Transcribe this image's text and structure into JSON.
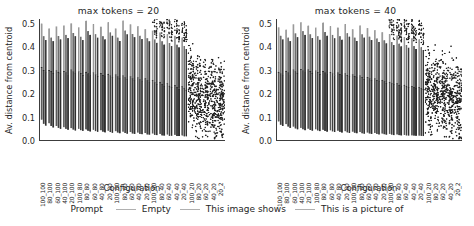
{
  "figure": {
    "width": 474,
    "height": 226,
    "background": "#ffffff"
  },
  "legend": {
    "title": "Prompt",
    "entries": [
      {
        "label": "Empty",
        "color": "#b0b0b0"
      },
      {
        "label": "This image shows",
        "color": "#b0b0b0"
      },
      {
        "label": "This is a picture of",
        "color": "#b0b0b0"
      }
    ]
  },
  "chart_data": {
    "type": "bar",
    "title": "",
    "xlabel": "Configuration",
    "ylabel": "Av. distance from centroid",
    "ylim": [
      0.0,
      0.52
    ],
    "yticks": [
      0.0,
      0.1,
      0.2,
      0.3,
      0.4,
      0.5
    ],
    "ytick_labels": [
      "0.0",
      "0.1",
      "0.2",
      "0.3",
      "0.4",
      "0.5"
    ],
    "grid": false,
    "legend_position": "bottom-center",
    "panels": [
      {
        "title": "max tokens = 20",
        "categories": [
          "100_100",
          "80_100",
          "60_100",
          "40_100",
          "20_100",
          "100_80",
          "80_80",
          "60_80",
          "40_80",
          "20_80",
          "100_60",
          "80_60",
          "60_60",
          "40_60",
          "20_60",
          "100_40",
          "80_40",
          "60_40",
          "40_40",
          "20_40",
          "100_20",
          "80_20",
          "60_20",
          "40_20",
          "20_2"
        ],
        "series": [
          {
            "name": "Empty",
            "values": [
              0.313,
              0.3,
              0.299,
              0.296,
              0.302,
              0.295,
              0.293,
              0.289,
              0.288,
              0.284,
              0.281,
              0.276,
              0.272,
              0.268,
              0.265,
              0.258,
              0.25,
              0.243,
              0.236,
              0.23,
              0.215,
              0.205,
              0.196,
              0.188,
              0.178
            ],
            "whisker_high": [
              0.5,
              0.479,
              0.488,
              0.492,
              0.501,
              0.484,
              0.512,
              0.498,
              0.487,
              0.506,
              0.479,
              0.513,
              0.497,
              0.489,
              0.476,
              0.47,
              0.462,
              0.455,
              0.448,
              0.44,
              0.43,
              0.42,
              0.41,
              0.4,
              0.392
            ],
            "whisker_low": [
              0.088,
              0.072,
              0.06,
              0.055,
              0.051,
              0.048,
              0.046,
              0.044,
              0.042,
              0.04,
              0.038,
              0.036,
              0.034,
              0.032,
              0.03,
              0.028,
              0.026,
              0.024,
              0.022,
              0.02,
              0.018,
              0.016,
              0.014,
              0.012,
              0.01
            ]
          },
          {
            "name": "This image shows",
            "values": [
              0.3,
              0.296,
              0.293,
              0.29,
              0.294,
              0.288,
              0.286,
              0.282,
              0.28,
              0.276,
              0.272,
              0.268,
              0.264,
              0.26,
              0.256,
              0.248,
              0.24,
              0.233,
              0.227,
              0.221,
              0.207,
              0.197,
              0.189,
              0.181,
              0.172
            ],
            "whisker_high": [
              0.446,
              0.44,
              0.447,
              0.452,
              0.46,
              0.444,
              0.468,
              0.455,
              0.446,
              0.462,
              0.44,
              0.47,
              0.456,
              0.448,
              0.437,
              0.432,
              0.424,
              0.417,
              0.41,
              0.404,
              0.394,
              0.386,
              0.378,
              0.37,
              0.36
            ],
            "whisker_low": [
              0.07,
              0.06,
              0.052,
              0.048,
              0.045,
              0.042,
              0.04,
              0.038,
              0.036,
              0.034,
              0.032,
              0.03,
              0.028,
              0.026,
              0.024,
              0.022,
              0.02,
              0.018,
              0.017,
              0.016,
              0.015,
              0.014,
              0.013,
              0.012,
              0.011
            ]
          },
          {
            "name": "This is a picture of",
            "values": [
              0.29,
              0.288,
              0.285,
              0.282,
              0.286,
              0.28,
              0.278,
              0.274,
              0.272,
              0.268,
              0.264,
              0.26,
              0.256,
              0.252,
              0.248,
              0.24,
              0.232,
              0.226,
              0.22,
              0.214,
              0.2,
              0.191,
              0.183,
              0.175,
              0.166
            ],
            "whisker_high": [
              0.43,
              0.425,
              0.432,
              0.438,
              0.446,
              0.43,
              0.452,
              0.44,
              0.432,
              0.448,
              0.426,
              0.454,
              0.442,
              0.434,
              0.424,
              0.418,
              0.41,
              0.404,
              0.398,
              0.392,
              0.382,
              0.374,
              0.366,
              0.358,
              0.348
            ],
            "whisker_low": [
              0.062,
              0.054,
              0.048,
              0.044,
              0.041,
              0.039,
              0.037,
              0.035,
              0.033,
              0.031,
              0.029,
              0.027,
              0.026,
              0.025,
              0.023,
              0.021,
              0.019,
              0.018,
              0.017,
              0.016,
              0.015,
              0.014,
              0.013,
              0.012,
              0.011
            ]
          }
        ],
        "outlier_region_start_index": 15,
        "scatter_region_start_index": 20
      },
      {
        "title": "max tokens = 40",
        "categories": [
          "100_100",
          "80_100",
          "60_100",
          "40_100",
          "20_100",
          "100_80",
          "80_80",
          "60_80",
          "40_80",
          "20_80",
          "100_60",
          "80_60",
          "60_60",
          "40_60",
          "20_60",
          "100_40",
          "80_40",
          "60_40",
          "40_40",
          "20_40",
          "100_20",
          "80_20",
          "60_20",
          "40_20",
          "20_2"
        ],
        "series": [
          {
            "name": "Empty",
            "values": [
              0.293,
              0.297,
              0.302,
              0.305,
              0.303,
              0.298,
              0.296,
              0.292,
              0.29,
              0.286,
              0.282,
              0.276,
              0.27,
              0.264,
              0.258,
              0.25,
              0.243,
              0.237,
              0.232,
              0.228,
              0.216,
              0.206,
              0.197,
              0.189,
              0.18
            ],
            "whisker_high": [
              0.484,
              0.474,
              0.497,
              0.506,
              0.491,
              0.483,
              0.504,
              0.489,
              0.483,
              0.498,
              0.476,
              0.492,
              0.481,
              0.472,
              0.463,
              0.456,
              0.449,
              0.443,
              0.437,
              0.432,
              0.422,
              0.414,
              0.406,
              0.398,
              0.388
            ],
            "whisker_low": [
              0.08,
              0.068,
              0.058,
              0.052,
              0.049,
              0.046,
              0.044,
              0.042,
              0.04,
              0.038,
              0.036,
              0.034,
              0.032,
              0.03,
              0.028,
              0.026,
              0.024,
              0.022,
              0.02,
              0.019,
              0.017,
              0.016,
              0.014,
              0.013,
              0.011
            ]
          },
          {
            "name": "This image shows",
            "values": [
              0.285,
              0.29,
              0.295,
              0.298,
              0.296,
              0.291,
              0.289,
              0.285,
              0.283,
              0.279,
              0.275,
              0.27,
              0.264,
              0.258,
              0.252,
              0.244,
              0.237,
              0.232,
              0.227,
              0.223,
              0.21,
              0.2,
              0.192,
              0.184,
              0.175
            ],
            "whisker_high": [
              0.448,
              0.44,
              0.458,
              0.468,
              0.454,
              0.446,
              0.464,
              0.452,
              0.446,
              0.459,
              0.44,
              0.454,
              0.444,
              0.436,
              0.428,
              0.421,
              0.414,
              0.409,
              0.403,
              0.398,
              0.389,
              0.381,
              0.374,
              0.366,
              0.357
            ],
            "whisker_low": [
              0.066,
              0.058,
              0.05,
              0.046,
              0.043,
              0.041,
              0.039,
              0.037,
              0.035,
              0.033,
              0.031,
              0.029,
              0.028,
              0.026,
              0.025,
              0.023,
              0.021,
              0.02,
              0.019,
              0.018,
              0.016,
              0.015,
              0.014,
              0.013,
              0.012
            ]
          },
          {
            "name": "This is a picture of",
            "values": [
              0.277,
              0.282,
              0.287,
              0.29,
              0.288,
              0.284,
              0.282,
              0.278,
              0.276,
              0.272,
              0.268,
              0.263,
              0.257,
              0.252,
              0.246,
              0.238,
              0.231,
              0.226,
              0.221,
              0.217,
              0.204,
              0.195,
              0.187,
              0.179,
              0.17
            ],
            "whisker_high": [
              0.432,
              0.425,
              0.442,
              0.452,
              0.438,
              0.431,
              0.448,
              0.437,
              0.431,
              0.444,
              0.426,
              0.44,
              0.43,
              0.422,
              0.415,
              0.408,
              0.402,
              0.397,
              0.391,
              0.386,
              0.378,
              0.37,
              0.363,
              0.356,
              0.347
            ],
            "whisker_low": [
              0.06,
              0.052,
              0.046,
              0.042,
              0.04,
              0.038,
              0.036,
              0.034,
              0.032,
              0.03,
              0.029,
              0.027,
              0.026,
              0.024,
              0.023,
              0.021,
              0.02,
              0.019,
              0.018,
              0.017,
              0.015,
              0.014,
              0.013,
              0.012,
              0.011
            ]
          }
        ],
        "outlier_region_start_index": 15,
        "scatter_region_start_index": 20
      }
    ]
  }
}
